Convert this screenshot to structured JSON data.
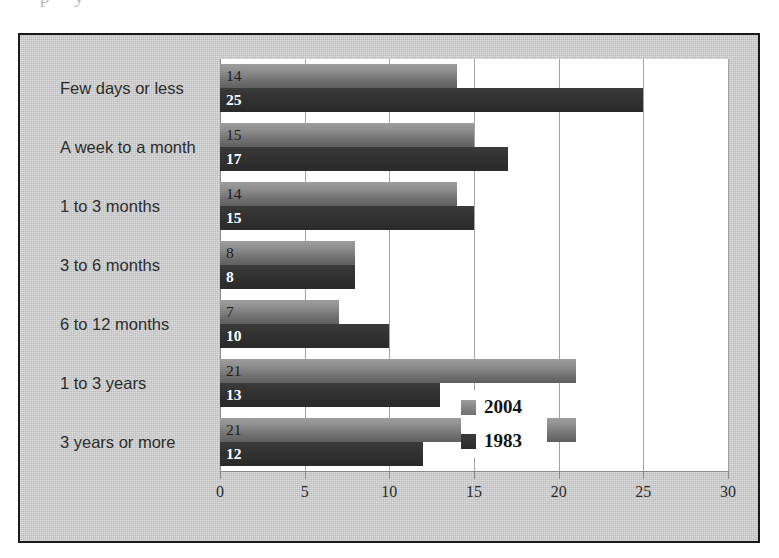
{
  "top_bleed_text": "p y",
  "chart_data": {
    "type": "bar",
    "orientation": "horizontal",
    "title": "",
    "subtitle": "",
    "xlabel": "",
    "ylabel": "",
    "xlim": [
      0,
      30
    ],
    "xticks": [
      0,
      5,
      10,
      15,
      20,
      25,
      30
    ],
    "xtick_labels": [
      "0",
      "5",
      "10",
      "15",
      "20",
      "25",
      "30"
    ],
    "grid": true,
    "grid_axis": "x",
    "legend_position": "center-right",
    "categories": [
      "Few days or less",
      "A week to a month",
      "1 to 3 months",
      "3 to 6 months",
      "6  to 12 months",
      "1 to 3 years",
      "3 years or more"
    ],
    "series": [
      {
        "name": "2004",
        "color": "#8f8f8f",
        "values": [
          14,
          15,
          14,
          8,
          7,
          21,
          21
        ],
        "labels": [
          "14",
          "15",
          "14",
          "8",
          "7",
          "21",
          "21"
        ]
      },
      {
        "name": "1983",
        "color": "#2f2f2f",
        "values": [
          25,
          17,
          15,
          8,
          10,
          13,
          12
        ],
        "labels": [
          "25",
          "17",
          "15",
          "8",
          "10",
          "13",
          "12"
        ]
      }
    ]
  },
  "legend": {
    "items": [
      {
        "label": "2004",
        "swatch": "y2004"
      },
      {
        "label": "1983",
        "swatch": "y1983"
      }
    ]
  },
  "colors": {
    "figure_background": "#c9c9c9",
    "figure_border": "#1b1b1b",
    "plot_background": "#ffffff",
    "gridline": "#a3a3a3",
    "series_2004": "#8f8f8f",
    "series_1983": "#2f2f2f",
    "axis_text": "#2b2b2b"
  }
}
